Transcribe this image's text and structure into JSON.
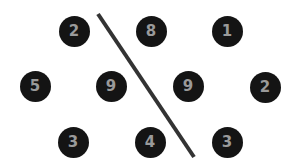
{
  "colors": {
    "background": "#ffffff",
    "circle_fill": "#141414",
    "digit_color": "#9a9a9a",
    "line_color": "#333333"
  },
  "line": {
    "x1": 98,
    "y1": 14,
    "x2": 194,
    "y2": 157,
    "stroke_width": 4
  },
  "nodes": [
    {
      "label": "2",
      "x": 74,
      "y": 31
    },
    {
      "label": "8",
      "x": 151,
      "y": 31
    },
    {
      "label": "1",
      "x": 227,
      "y": 31
    },
    {
      "label": "5",
      "x": 35,
      "y": 86
    },
    {
      "label": "9",
      "x": 111,
      "y": 86
    },
    {
      "label": "9",
      "x": 188,
      "y": 86
    },
    {
      "label": "2",
      "x": 265,
      "y": 87
    },
    {
      "label": "3",
      "x": 73,
      "y": 142
    },
    {
      "label": "4",
      "x": 150,
      "y": 142
    },
    {
      "label": "3",
      "x": 227,
      "y": 142
    }
  ]
}
